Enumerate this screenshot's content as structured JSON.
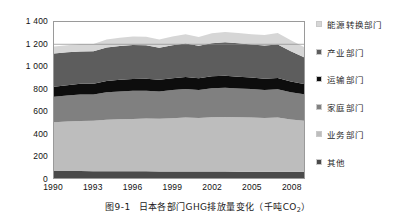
{
  "caption": {
    "number": "图9-1",
    "text": "日本各部门GHG排放量变化（千吨CO",
    "sub": "2",
    "tail": "）"
  },
  "legend": {
    "items": [
      {
        "label": "能源转换部门",
        "color": "#d6d6d6"
      },
      {
        "label": "产业部门",
        "color": "#5d5d5d"
      },
      {
        "label": "运输部门",
        "color": "#0d0d0d"
      },
      {
        "label": "家庭部门",
        "color": "#808080"
      },
      {
        "label": "业务部门",
        "color": "#bdbdbd"
      },
      {
        "label": "其他",
        "color": "#4a4a4a"
      }
    ]
  },
  "chart_data": {
    "type": "area",
    "stacked": true,
    "title": "日本各部门GHG排放量变化（千吨CO2）",
    "xlabel": "",
    "ylabel": "",
    "grid": false,
    "legend_position": "right",
    "ylim": [
      0,
      1400
    ],
    "yticks": [
      0,
      200,
      400,
      600,
      800,
      1000,
      1200,
      1400
    ],
    "ytick_labels": [
      "0",
      "200",
      "400",
      "600",
      "800",
      "1 000",
      "1 200",
      "1 400"
    ],
    "xlim": [
      1990,
      2009
    ],
    "xticks": [
      1990,
      1993,
      1996,
      1999,
      2002,
      2005,
      2008
    ],
    "xtick_labels": [
      "1990",
      "1993",
      "1996",
      "1999",
      "2002",
      "2005",
      "2008"
    ],
    "x": [
      1990,
      1991,
      1992,
      1993,
      1994,
      1995,
      1996,
      1997,
      1998,
      1999,
      2000,
      2001,
      2002,
      2003,
      2004,
      2005,
      2006,
      2007,
      2008,
      2009
    ],
    "stack_order_bottom_to_top": [
      "其他",
      "业务部门",
      "家庭部门",
      "运输部门",
      "产业部门",
      "能源转换部门"
    ],
    "series": [
      {
        "name": "其他",
        "color": "#4a4a4a",
        "values": [
          62,
          62,
          62,
          61,
          61,
          61,
          60,
          60,
          59,
          59,
          59,
          58,
          58,
          58,
          57,
          57,
          57,
          56,
          56,
          55
        ]
      },
      {
        "name": "业务部门",
        "color": "#bdbdbd",
        "values": [
          438,
          444,
          450,
          452,
          462,
          466,
          470,
          474,
          472,
          478,
          484,
          480,
          488,
          490,
          488,
          486,
          482,
          486,
          470,
          458
        ]
      },
      {
        "name": "家庭部门",
        "color": "#808080",
        "values": [
          230,
          234,
          238,
          236,
          246,
          250,
          252,
          250,
          246,
          252,
          256,
          252,
          260,
          262,
          258,
          256,
          250,
          254,
          244,
          238
        ]
      },
      {
        "name": "运输部门",
        "color": "#0d0d0d",
        "values": [
          88,
          92,
          96,
          96,
          102,
          104,
          106,
          106,
          104,
          106,
          108,
          106,
          108,
          108,
          106,
          104,
          102,
          102,
          96,
          92
        ]
      },
      {
        "name": "产业部门",
        "color": "#5d5d5d",
        "values": [
          300,
          296,
          290,
          292,
          300,
          304,
          306,
          302,
          288,
          296,
          300,
          290,
          296,
          300,
          300,
          296,
          298,
          300,
          272,
          240
        ]
      },
      {
        "name": "能源转换部门",
        "color": "#d6d6d6",
        "values": [
          62,
          64,
          66,
          66,
          72,
          74,
          76,
          76,
          74,
          78,
          82,
          80,
          88,
          92,
          92,
          92,
          94,
          104,
          98,
          92
        ]
      }
    ],
    "totals": [
      1180,
      1192,
      1202,
      1203,
      1243,
      1259,
      1270,
      1268,
      1243,
      1269,
      1289,
      1266,
      1298,
      1310,
      1301,
      1291,
      1283,
      1302,
      1236,
      1175
    ],
    "units": "千吨CO2"
  }
}
